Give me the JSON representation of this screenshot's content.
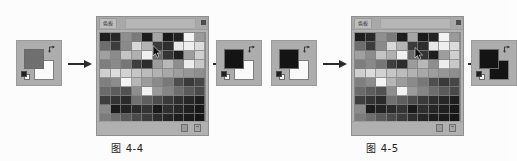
{
  "page": {
    "background_color": "#fcfcfc",
    "figure_count": 2
  },
  "figures": [
    {
      "id": "figure-4-4",
      "caption": "图 4-4",
      "input_thumbnail": {
        "name": "foreground-background-color-picker",
        "foreground_color": "#6f6f6f",
        "background_color": "#fafafa",
        "swap_icon": "swap-arrow-icon",
        "default_icon": "default-colors-icon"
      },
      "arrow_left": {
        "icon": "right-arrow-icon"
      },
      "panel": {
        "title": "色板",
        "menu_icon": "panel-menu-icon",
        "footer": {
          "new_swatch_icon": "new-swatch-icon",
          "delete_swatch_icon": "delete-swatch-icon"
        },
        "cursor": {
          "icon": "eyedropper-cursor-icon",
          "x": 55,
          "y": 28
        },
        "columns": 10,
        "rows": 11,
        "swatches": [
          "#1e1e1e",
          "#282828",
          "#8f8f8f",
          "#7a7a7a",
          "#1c1c1c",
          "#a5a5a5",
          "#1a1a1a",
          "#222222",
          "#f2f2f2",
          "#9a9a9a",
          "#6e6e6e",
          "#3c3c3c",
          "#8a8a8a",
          "#d8d8d8",
          "#b4b4b4",
          "#3a3a3a",
          "#2e2e2e",
          "#e8e8e8",
          "#efefef",
          "#dcdcdc",
          "#a0a0a0",
          "#8c8c8c",
          "#c4c4c4",
          "#b0b0b0",
          "#f0f0f0",
          "#6a6a6a",
          "#353535",
          "#1f1f1f",
          "#9e9e9e",
          "#cfcfcf",
          "#7e7e7e",
          "#8a8a8a",
          "#767676",
          "#3e3e3e",
          "#2c2c2c",
          "#9c9c9c",
          "#b8b8b8",
          "#8e8e8e",
          "#ededed",
          "#c8c8c8",
          "#cfcfcf",
          "#dcdcdc",
          "#d2d2d2",
          "#c6c6c6",
          "#bcbcbc",
          "#b2b2b2",
          "#a8a8a8",
          "#9e9e9e",
          "#969696",
          "#8e8e8e",
          "#7f7f7f",
          "#8c8c8c",
          "#f4f4f4",
          "#b6b6b6",
          "#9c9c9c",
          "#8a8a8a",
          "#787878",
          "#4e4e4e",
          "#3a3a3a",
          "#464646",
          "#6a6a6a",
          "#5c5c5c",
          "#525252",
          "#8e8e8e",
          "#f2f2f2",
          "#9a9a9a",
          "#858585",
          "#6e6e6e",
          "#5a5a5a",
          "#4a4a4a",
          "#3e3e3e",
          "#343434",
          "#2a2a2a",
          "#707070",
          "#5e5e5e",
          "#4c4c4c",
          "#3a3a3a",
          "#2e2e2e",
          "#262626",
          "#1e1e1e",
          "#8a8a8a",
          "#1c1c1c",
          "#222222",
          "#2a2a2a",
          "#343434",
          "#1a1a1a",
          "#2e2e2e",
          "#262626",
          "#1f1f1f",
          "#181818",
          "#7c7c7c",
          "#6e6e6e",
          "#5a5a5a",
          "#4a4a4a",
          "#3c3c3c",
          "#2e2e2e",
          "#262626",
          "#1e1e1e",
          "#1a1a1a",
          "#161616",
          "#141414",
          "#1a1a1a",
          "#202020",
          "#262626",
          "#2c2c2c",
          "#222222",
          "#1c1c1c",
          "#181818",
          "#141414",
          "#101010"
        ]
      },
      "arrow_right": {
        "icon": "right-arrow-icon"
      },
      "output_thumbnail": {
        "name": "foreground-background-color-picker-result",
        "foreground_color": "#141414",
        "background_color": "#fafafa",
        "swap_icon": "swap-arrow-icon",
        "default_icon": "default-colors-icon"
      }
    },
    {
      "id": "figure-4-5",
      "caption": "图 4-5",
      "input_thumbnail": {
        "name": "foreground-background-color-picker",
        "foreground_color": "#141414",
        "background_color": "#fafafa",
        "swap_icon": "swap-arrow-icon",
        "default_icon": "default-colors-icon"
      },
      "arrow_left": {
        "icon": "right-arrow-icon"
      },
      "panel": {
        "title": "色板",
        "menu_icon": "panel-menu-icon",
        "footer": {
          "new_swatch_icon": "new-swatch-icon",
          "delete_swatch_icon": "delete-swatch-icon"
        },
        "cursor": {
          "icon": "eyedropper-cursor-icon",
          "x": 62,
          "y": 30
        },
        "columns": 10,
        "rows": 11,
        "swatches": [
          "#1e1e1e",
          "#282828",
          "#8f8f8f",
          "#7a7a7a",
          "#1c1c1c",
          "#a5a5a5",
          "#1a1a1a",
          "#222222",
          "#f2f2f2",
          "#9a9a9a",
          "#6e6e6e",
          "#3c3c3c",
          "#8a8a8a",
          "#d8d8d8",
          "#b4b4b4",
          "#3a3a3a",
          "#2e2e2e",
          "#e8e8e8",
          "#efefef",
          "#dcdcdc",
          "#a0a0a0",
          "#8c8c8c",
          "#c4c4c4",
          "#b0b0b0",
          "#f0f0f0",
          "#6a6a6a",
          "#353535",
          "#1f1f1f",
          "#9e9e9e",
          "#cfcfcf",
          "#7e7e7e",
          "#8a8a8a",
          "#767676",
          "#3e3e3e",
          "#2c2c2c",
          "#9c9c9c",
          "#b8b8b8",
          "#8e8e8e",
          "#ededed",
          "#c8c8c8",
          "#cfcfcf",
          "#dcdcdc",
          "#d2d2d2",
          "#c6c6c6",
          "#bcbcbc",
          "#b2b2b2",
          "#a8a8a8",
          "#9e9e9e",
          "#969696",
          "#8e8e8e",
          "#7f7f7f",
          "#8c8c8c",
          "#f4f4f4",
          "#b6b6b6",
          "#9c9c9c",
          "#8a8a8a",
          "#787878",
          "#4e4e4e",
          "#3a3a3a",
          "#464646",
          "#6a6a6a",
          "#5c5c5c",
          "#525252",
          "#8e8e8e",
          "#f2f2f2",
          "#9a9a9a",
          "#858585",
          "#6e6e6e",
          "#5a5a5a",
          "#4a4a4a",
          "#3e3e3e",
          "#343434",
          "#2a2a2a",
          "#707070",
          "#5e5e5e",
          "#4c4c4c",
          "#3a3a3a",
          "#2e2e2e",
          "#262626",
          "#1e1e1e",
          "#8a8a8a",
          "#1c1c1c",
          "#222222",
          "#2a2a2a",
          "#343434",
          "#1a1a1a",
          "#2e2e2e",
          "#262626",
          "#1f1f1f",
          "#181818",
          "#7c7c7c",
          "#6e6e6e",
          "#5a5a5a",
          "#4a4a4a",
          "#3c3c3c",
          "#2e2e2e",
          "#262626",
          "#1e1e1e",
          "#1a1a1a",
          "#161616",
          "#141414",
          "#1a1a1a",
          "#202020",
          "#262626",
          "#2c2c2c",
          "#222222",
          "#1c1c1c",
          "#181818",
          "#141414",
          "#101010"
        ]
      },
      "arrow_right": {
        "icon": "right-arrow-icon"
      },
      "output_thumbnail": {
        "name": "foreground-background-color-picker-result",
        "foreground_color": "#141414",
        "background_color": "#141414",
        "swap_icon": "swap-arrow-icon",
        "default_icon": "default-colors-icon"
      }
    }
  ]
}
